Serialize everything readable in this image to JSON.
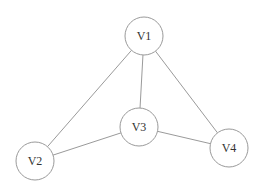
{
  "graph": {
    "nodes": [
      {
        "id": "V1",
        "label": "V1",
        "x": 144,
        "y": 36,
        "r": 19
      },
      {
        "id": "V2",
        "label": "V2",
        "x": 35,
        "y": 161,
        "r": 19
      },
      {
        "id": "V3",
        "label": "V3",
        "x": 139,
        "y": 127,
        "r": 19
      },
      {
        "id": "V4",
        "label": "V4",
        "x": 229,
        "y": 148,
        "r": 19
      }
    ],
    "edges": [
      {
        "from": "V1",
        "to": "V2"
      },
      {
        "from": "V1",
        "to": "V3"
      },
      {
        "from": "V1",
        "to": "V4"
      },
      {
        "from": "V2",
        "to": "V3"
      },
      {
        "from": "V3",
        "to": "V4"
      }
    ]
  },
  "colors": {
    "stroke": "#9a9a9a",
    "label": "#333333",
    "background": "#ffffff"
  }
}
